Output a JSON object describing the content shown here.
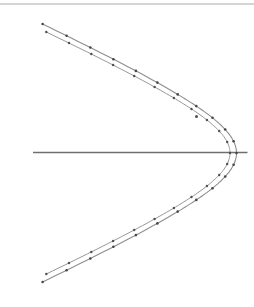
{
  "figure": {
    "width": 254,
    "height": 307,
    "background": "#ffffff",
    "top_border": {
      "y": 4,
      "color": "#c6c6c6",
      "thickness": 1.6
    }
  },
  "chart_data": {
    "type": "line",
    "title": "",
    "xlabel": "",
    "ylabel": "",
    "grid": false,
    "legend": null,
    "axes_ticks": "none",
    "coordinate_space": "screen pixels, 254x307, y increases downward",
    "axis_line": {
      "x1": 33,
      "x2": 247.5,
      "y": 152.5,
      "color": "#6f6f6f",
      "width": 1.3
    },
    "stray_point": {
      "x": 196.5,
      "y": 116.5,
      "radius": 1.5,
      "color": "#4f4f4f"
    },
    "series": [
      {
        "name": "outer trajectory",
        "line_color": "#8e8e8e",
        "line_width": 1.1,
        "marker": "dot",
        "marker_color": "#474747",
        "marker_radius": 1.3,
        "model": {
          "type": "hyperbola-left-branch",
          "cx": 351.5,
          "cy": 153,
          "a": 115,
          "b": 51.75,
          "t_max": 1.6446
        },
        "points": [
          [
            42.6,
            24.0
          ],
          [
            66.6,
            35.7
          ],
          [
            90.3,
            47.5
          ],
          [
            113.4,
            59.2
          ],
          [
            135.9,
            70.9
          ],
          [
            157.4,
            82.6
          ],
          [
            177.7,
            94.4
          ],
          [
            196.3,
            106.1
          ],
          [
            212.5,
            117.8
          ],
          [
            225.2,
            129.5
          ],
          [
            233.6,
            141.3
          ],
          [
            236.5,
            153.0
          ],
          [
            233.6,
            164.7
          ],
          [
            225.2,
            176.5
          ],
          [
            212.5,
            188.2
          ],
          [
            196.3,
            199.9
          ],
          [
            177.7,
            211.6
          ],
          [
            157.4,
            223.4
          ],
          [
            135.9,
            235.1
          ],
          [
            113.4,
            246.8
          ],
          [
            90.3,
            258.5
          ],
          [
            66.6,
            270.3
          ],
          [
            42.6,
            282.0
          ]
        ]
      },
      {
        "name": "inner trajectory",
        "line_color": "#979797",
        "line_width": 1.0,
        "marker": "dot",
        "marker_color": "#4f4f4f",
        "marker_radius": 1.2,
        "model": {
          "type": "hyperbola-left-branch",
          "cx": 335,
          "cy": 153,
          "a": 105,
          "b": 47.25,
          "t_max": 1.6696
        },
        "points": [
          [
            46.3,
            32.0
          ],
          [
            69.0,
            43.0
          ],
          [
            91.3,
            54.0
          ],
          [
            113.1,
            65.0
          ],
          [
            134.2,
            76.0
          ],
          [
            154.6,
            87.0
          ],
          [
            173.9,
            98.0
          ],
          [
            191.5,
            109.0
          ],
          [
            206.9,
            120.0
          ],
          [
            219.2,
            131.0
          ],
          [
            227.2,
            142.0
          ],
          [
            230.0,
            153.0
          ],
          [
            227.2,
            164.0
          ],
          [
            219.2,
            175.0
          ],
          [
            206.9,
            186.0
          ],
          [
            191.5,
            197.0
          ],
          [
            173.9,
            208.0
          ],
          [
            154.6,
            219.0
          ],
          [
            134.2,
            230.0
          ],
          [
            113.1,
            241.0
          ],
          [
            91.3,
            252.0
          ],
          [
            69.0,
            263.0
          ],
          [
            46.3,
            274.0
          ]
        ]
      }
    ]
  }
}
